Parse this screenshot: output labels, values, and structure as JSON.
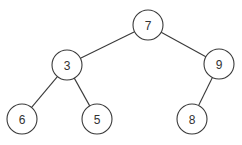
{
  "diagram": {
    "type": "binary-tree",
    "node_radius": 15,
    "colors": {
      "background": "#ffffff",
      "stroke": "#3a3a3a",
      "label": "#333333"
    },
    "nodes": [
      {
        "id": "n7",
        "label": "7",
        "x": 148,
        "y": 25
      },
      {
        "id": "n3",
        "label": "3",
        "x": 67,
        "y": 65
      },
      {
        "id": "n9",
        "label": "9",
        "x": 219,
        "y": 64
      },
      {
        "id": "n6",
        "label": "6",
        "x": 22,
        "y": 119
      },
      {
        "id": "n5",
        "label": "5",
        "x": 97,
        "y": 119
      },
      {
        "id": "n8",
        "label": "8",
        "x": 192,
        "y": 119
      }
    ],
    "edges": [
      {
        "from": "n7",
        "to": "n3"
      },
      {
        "from": "n7",
        "to": "n9"
      },
      {
        "from": "n3",
        "to": "n6"
      },
      {
        "from": "n3",
        "to": "n5"
      },
      {
        "from": "n9",
        "to": "n8"
      }
    ]
  }
}
